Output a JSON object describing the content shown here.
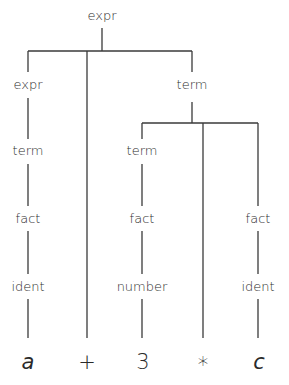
{
  "diagram": {
    "type": "parse-tree",
    "root": {
      "label": "expr",
      "children": [
        {
          "label": "expr",
          "children": [
            {
              "label": "term",
              "children": [
                {
                  "label": "fact",
                  "children": [
                    {
                      "label": "ident",
                      "children": [
                        {
                          "label": "a"
                        }
                      ]
                    }
                  ]
                }
              ]
            }
          ]
        },
        {
          "label": "+"
        },
        {
          "label": "term",
          "children": [
            {
              "label": "term",
              "children": [
                {
                  "label": "fact",
                  "children": [
                    {
                      "label": "number",
                      "children": [
                        {
                          "label": "3"
                        }
                      ]
                    }
                  ]
                }
              ]
            },
            {
              "label": "*"
            },
            {
              "label": "fact",
              "children": [
                {
                  "label": "ident",
                  "children": [
                    {
                      "label": "c"
                    }
                  ]
                }
              ]
            }
          ]
        }
      ]
    },
    "labels": {
      "root_expr": "expr",
      "left_expr": "expr",
      "left_term": "term",
      "left_fact": "fact",
      "left_ident": "ident",
      "right_term": "term",
      "mid_term": "term",
      "mid_fact": "fact",
      "mid_number": "number",
      "right_fact": "fact",
      "right_ident": "ident"
    },
    "leaves": [
      "a",
      "+",
      "3",
      "*",
      "c"
    ]
  }
}
